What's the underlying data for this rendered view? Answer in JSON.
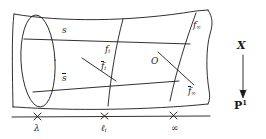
{
  "figure": {
    "type": "ruled-surface-fibration-diagram",
    "stroke_color": "#1a1a1a",
    "background_color": "#ffffff"
  },
  "surface_labels": {
    "section_top": "s",
    "section_bottom": "s̄",
    "fiber_i": "f",
    "fiber_i_sub": "i",
    "fiber_i_bar": "f̄",
    "fiber_i_bar_sub": "i",
    "fiber_infinity": "f",
    "fiber_infinity_sub": "∞",
    "fiber_infinity_bar": "f̄",
    "fiber_infinity_bar_sub": "∞",
    "point_O": "O"
  },
  "base_axis": {
    "tick_marks": [
      "×",
      "×",
      "×"
    ],
    "tick_labels": [
      "λ",
      "ℓ",
      "∞"
    ],
    "tick_label_subs": [
      "",
      "i",
      ""
    ]
  },
  "map": {
    "source": "X",
    "target": "P",
    "target_sup": "1",
    "arrow": "downward-arrow"
  }
}
